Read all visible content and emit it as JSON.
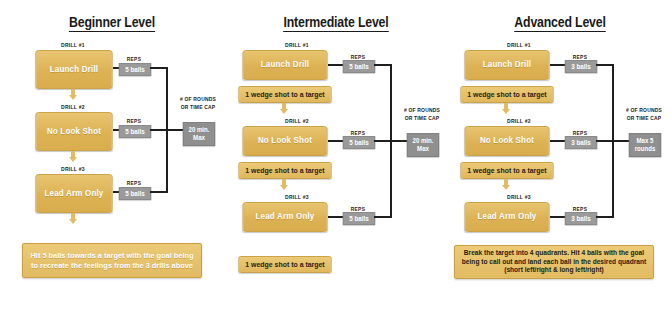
{
  "diagram": {
    "background": "#ffffff",
    "colors": {
      "gold": "#ddb254",
      "gold_light": "#ecca77",
      "gray_chip": "#9a9a9a",
      "connector": "#1f1f1f",
      "text_dark": "#1a1a1a",
      "text_white": "#ffffff"
    }
  },
  "columns": [
    {
      "id": "beginner",
      "title": "Beginner Level",
      "drills": [
        {
          "label": "DRILL #1",
          "name": "Launch Drill",
          "reps_label": "REPS",
          "reps": "5 balls"
        },
        {
          "label": "DRILL #2",
          "name": "No Look Shot",
          "reps_label": "REPS",
          "reps": "5 balls"
        },
        {
          "label": "DRILL #3",
          "name": "Lead Arm Only",
          "reps_label": "REPS",
          "reps": "5 balls"
        }
      ],
      "sub_boxes": [],
      "cap": {
        "label": "# OF ROUNDS OR TIME CAP",
        "value": "20 min. Max"
      },
      "summary": "Hit 5 balls towards a target with the goal being to recreate the feelings from the 3 drills above",
      "summary_style": "white-text"
    },
    {
      "id": "intermediate",
      "title": "Intermediate Level",
      "drills": [
        {
          "label": "DRILL #1",
          "name": "Launch Drill",
          "reps_label": "REPS",
          "reps": "5 balls"
        },
        {
          "label": "DRILL #2",
          "name": "No Look Shot",
          "reps_label": "REPS",
          "reps": "5 balls"
        },
        {
          "label": "DRILL #3",
          "name": "Lead Arm Only",
          "reps_label": "REPS",
          "reps": "5 balls"
        }
      ],
      "sub_boxes": [
        "1 wedge shot to a target",
        "1 wedge shot to a target",
        "1 wedge shot to a target"
      ],
      "cap": {
        "label": "# OF ROUNDS OR TIME CAP",
        "value": "20 min. Max"
      },
      "summary": "",
      "summary_style": "none"
    },
    {
      "id": "advanced",
      "title": "Advanced Level",
      "drills": [
        {
          "label": "DRILL #1",
          "name": "Launch Drill",
          "reps_label": "REPS",
          "reps": "3 balls"
        },
        {
          "label": "DRILL #2",
          "name": "No Look Shot",
          "reps_label": "REPS",
          "reps": "3 balls"
        },
        {
          "label": "DRILL #3",
          "name": "Lead Arm Only",
          "reps_label": "REPS",
          "reps": "3 balls"
        }
      ],
      "sub_boxes": [
        "1 wedge shot to a target",
        "1 wedge shot to a target"
      ],
      "cap": {
        "label": "# OF ROUNDS OR TIME CAP",
        "value": "Max 5 rounds"
      },
      "summary": "Break the target into 4 quadrants. Hit 4 balls with the goal being to call out and land each ball in the desired quadrant (short left/right & long left/right)",
      "summary_style": "dark-text"
    }
  ]
}
